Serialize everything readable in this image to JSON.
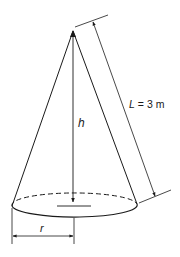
{
  "figure": {
    "labels": {
      "height": "h",
      "slant_length": "L = 3 m",
      "slant_symbol": "L",
      "slant_value": "= 3 m",
      "radius": "r"
    },
    "colors": {
      "stroke": "#1a1a1a",
      "background": "#ffffff"
    }
  }
}
